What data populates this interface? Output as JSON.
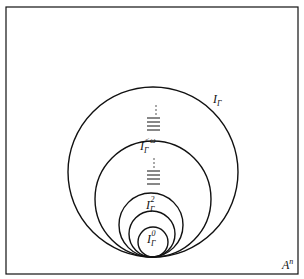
{
  "diagram": {
    "frame_label": {
      "base": "A",
      "sup": "n"
    },
    "circles": [
      {
        "id": "I_Gamma",
        "cx": 153,
        "cy": 172,
        "r": 85
      },
      {
        "id": "I_Gamma_lt_omega",
        "cx": 153,
        "cy": 199,
        "r": 58
      },
      {
        "id": "I_Gamma_2",
        "cx": 151,
        "cy": 225,
        "r": 32
      },
      {
        "id": "I_Gamma_1",
        "cx": 152,
        "cy": 234,
        "r": 23
      },
      {
        "id": "I_Gamma_0",
        "cx": 153,
        "cy": 242,
        "r": 15
      }
    ],
    "labels": {
      "outer": {
        "base": "I",
        "sub": "Γ"
      },
      "lt_omega": {
        "base": "I",
        "sub": "Γ",
        "sup": "<ω"
      },
      "two": {
        "base": "I",
        "sub": "Γ",
        "sup": "2"
      },
      "zero": {
        "base": "I",
        "sub": "Γ",
        "sup": "0"
      }
    },
    "ellipsis": "⋮"
  }
}
